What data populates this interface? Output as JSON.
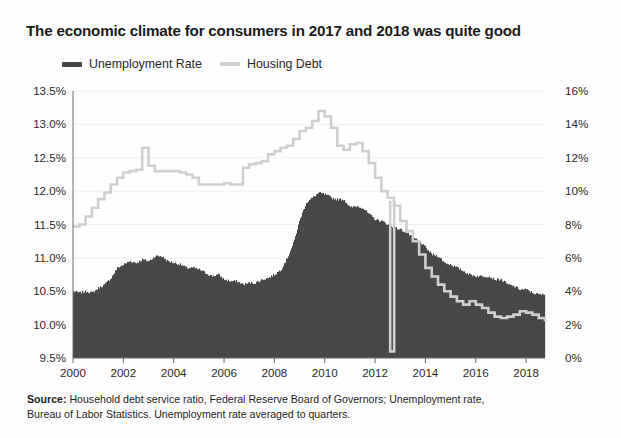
{
  "title": "The economic climate for consumers in 2017 and 2018 was quite good",
  "legend": {
    "items": [
      {
        "label": "Unemployment Rate",
        "color": "#444444",
        "icon": "line-swatch-icon"
      },
      {
        "label": "Housing Debt",
        "color": "#cfcfcf",
        "icon": "line-swatch-icon"
      }
    ]
  },
  "source": {
    "prefix": "Source:",
    "text": " Household debt service ratio, Federal Reserve Board of Governors; Unemployment rate, Bureau of Labor Statistics. Unemployment rate averaged to quarters."
  },
  "chart_data": {
    "type": "area",
    "title": "The economic climate for consumers in 2017 and 2018 was quite good",
    "xlabel": "",
    "ylabel": "",
    "grid": true,
    "legend_position": "top-left",
    "xlim": [
      2000,
      2018.75
    ],
    "xticks": [
      2000,
      2002,
      2004,
      2006,
      2008,
      2010,
      2012,
      2014,
      2016,
      2018
    ],
    "xticklabels": [
      "2000",
      "2002",
      "2004",
      "2006",
      "2008",
      "2010",
      "2012",
      "2014",
      "2016",
      "2018"
    ],
    "left_axis": {
      "name": "Housing Debt",
      "ylim": [
        9.5,
        13.5
      ],
      "ticks": [
        9.5,
        10.0,
        10.5,
        11.0,
        11.5,
        12.0,
        12.5,
        13.0,
        13.5
      ],
      "ticklabels": [
        "9.5%",
        "10.0%",
        "10.5%",
        "11.0%",
        "11.5%",
        "12.0%",
        "12.5%",
        "13.0%",
        "13.5%"
      ]
    },
    "right_axis": {
      "name": "Unemployment Rate",
      "ylim": [
        0,
        16
      ],
      "ticks": [
        0,
        2,
        4,
        6,
        8,
        10,
        12,
        14,
        16
      ],
      "ticklabels": [
        "0%",
        "2%",
        "4%",
        "6%",
        "8%",
        "10%",
        "12%",
        "14%",
        "16%"
      ]
    },
    "series": [
      {
        "name": "Housing Debt",
        "axis": "left",
        "render": "line",
        "color": "#cfcfcf",
        "x": [
          2000.0,
          2000.25,
          2000.5,
          2000.75,
          2001.0,
          2001.25,
          2001.5,
          2001.75,
          2002.0,
          2002.25,
          2002.5,
          2002.75,
          2003.0,
          2003.25,
          2003.5,
          2003.75,
          2004.0,
          2004.25,
          2004.5,
          2004.75,
          2005.0,
          2005.25,
          2005.5,
          2005.75,
          2006.0,
          2006.25,
          2006.5,
          2006.75,
          2007.0,
          2007.25,
          2007.5,
          2007.75,
          2008.0,
          2008.25,
          2008.5,
          2008.75,
          2009.0,
          2009.25,
          2009.5,
          2009.75,
          2010.0,
          2010.25,
          2010.5,
          2010.75,
          2011.0,
          2011.25,
          2011.5,
          2011.75,
          2012.0,
          2012.25,
          2012.5,
          2012.75,
          2013.0,
          2013.25,
          2013.5,
          2013.75,
          2014.0,
          2014.25,
          2014.5,
          2014.75,
          2015.0,
          2015.25,
          2015.5,
          2015.75,
          2016.0,
          2016.25,
          2016.5,
          2016.75,
          2017.0,
          2017.25,
          2017.5,
          2017.75,
          2018.0,
          2018.25,
          2018.5,
          2018.75
        ],
        "values": [
          11.47,
          11.5,
          11.62,
          11.75,
          11.88,
          11.98,
          12.1,
          12.2,
          12.28,
          12.3,
          12.32,
          12.65,
          12.38,
          12.3,
          12.3,
          12.3,
          12.3,
          12.28,
          12.25,
          12.2,
          12.1,
          12.1,
          12.1,
          12.1,
          12.12,
          12.1,
          12.1,
          12.35,
          12.4,
          12.42,
          12.45,
          12.55,
          12.6,
          12.65,
          12.68,
          12.78,
          12.9,
          12.95,
          13.05,
          13.2,
          13.12,
          12.95,
          12.68,
          12.62,
          12.7,
          12.72,
          12.6,
          12.42,
          12.2,
          12.0,
          11.9,
          11.78,
          11.55,
          11.4,
          11.25,
          11.05,
          10.85,
          10.72,
          10.6,
          10.5,
          10.42,
          10.35,
          10.3,
          10.35,
          10.3,
          10.25,
          10.18,
          10.12,
          10.1,
          10.12,
          10.15,
          10.2,
          10.18,
          10.15,
          10.1,
          10.05
        ],
        "note_dip": {
          "x": 2012.6,
          "value": 9.6,
          "label": "sharp one-quarter dip"
        }
      },
      {
        "name": "Unemployment Rate",
        "axis": "right",
        "render": "filled-area",
        "color": "#474747",
        "x": [
          2000.0,
          2000.25,
          2000.5,
          2000.75,
          2001.0,
          2001.25,
          2001.5,
          2001.75,
          2002.0,
          2002.25,
          2002.5,
          2002.75,
          2003.0,
          2003.25,
          2003.5,
          2003.75,
          2004.0,
          2004.25,
          2004.5,
          2004.75,
          2005.0,
          2005.25,
          2005.5,
          2005.75,
          2006.0,
          2006.25,
          2006.5,
          2006.75,
          2007.0,
          2007.25,
          2007.5,
          2007.75,
          2008.0,
          2008.25,
          2008.5,
          2008.75,
          2009.0,
          2009.25,
          2009.5,
          2009.75,
          2010.0,
          2010.25,
          2010.5,
          2010.75,
          2011.0,
          2011.25,
          2011.5,
          2011.75,
          2012.0,
          2012.25,
          2012.5,
          2012.75,
          2013.0,
          2013.25,
          2013.5,
          2013.75,
          2014.0,
          2014.25,
          2014.5,
          2014.75,
          2015.0,
          2015.25,
          2015.5,
          2015.75,
          2016.0,
          2016.25,
          2016.5,
          2016.75,
          2017.0,
          2017.25,
          2017.5,
          2017.75,
          2018.0,
          2018.25,
          2018.5,
          2018.75
        ],
        "values": [
          4.0,
          3.9,
          4.0,
          3.9,
          4.2,
          4.4,
          4.8,
          5.4,
          5.6,
          5.8,
          5.7,
          5.9,
          5.8,
          6.1,
          6.1,
          5.8,
          5.7,
          5.6,
          5.4,
          5.4,
          5.3,
          5.1,
          4.9,
          5.0,
          4.7,
          4.6,
          4.6,
          4.4,
          4.5,
          4.5,
          4.7,
          4.8,
          5.0,
          5.3,
          6.0,
          6.9,
          8.3,
          9.3,
          9.6,
          9.9,
          9.8,
          9.6,
          9.5,
          9.5,
          9.0,
          9.1,
          9.0,
          8.6,
          8.3,
          8.2,
          8.0,
          7.8,
          7.7,
          7.5,
          7.2,
          7.0,
          6.6,
          6.2,
          6.1,
          5.7,
          5.6,
          5.4,
          5.2,
          5.0,
          4.9,
          4.9,
          4.9,
          4.7,
          4.7,
          4.4,
          4.3,
          4.1,
          4.1,
          3.9,
          3.8,
          3.8
        ]
      }
    ]
  }
}
